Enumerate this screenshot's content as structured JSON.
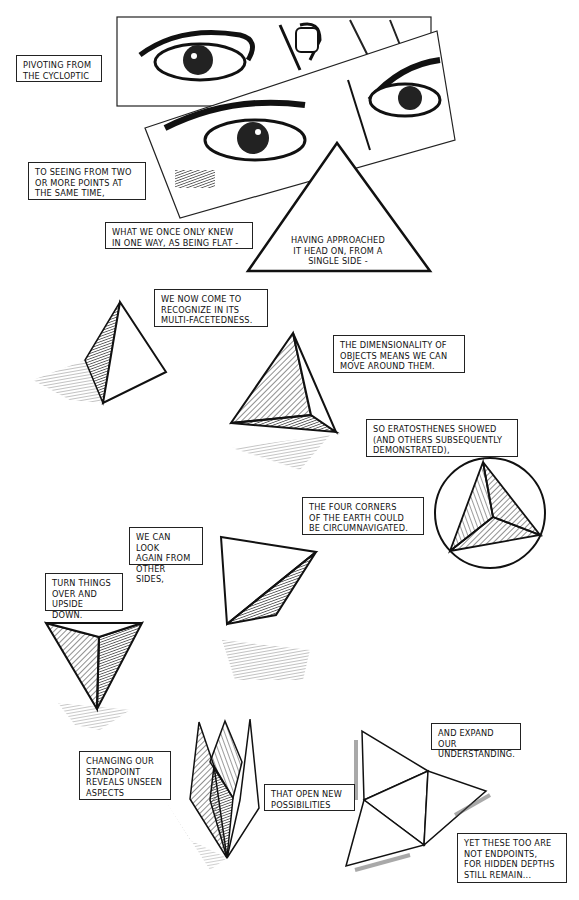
{
  "page": {
    "type": "comic-page",
    "style": "black-and-white ink illustration"
  },
  "captions": [
    {
      "id": "c1",
      "text": "PIVOTING FROM\nTHE CYCLOPTIC"
    },
    {
      "id": "c2",
      "text": "TO SEEING FROM TWO\nOR MORE POINTS AT\nTHE SAME TIME,"
    },
    {
      "id": "c3",
      "text": "WHAT WE ONCE ONLY KNEW\nIN ONE WAY, AS BEING FLAT -"
    },
    {
      "id": "c4",
      "text": "HAVING APPROACHED\nIT HEAD ON, FROM A\nSINGLE SIDE -"
    },
    {
      "id": "c5",
      "text": "WE NOW COME TO\nRECOGNIZE IN ITS\nMULTI-FACETEDNESS."
    },
    {
      "id": "c6",
      "text": "THE DIMENSIONALITY OF\nOBJECTS MEANS WE CAN\nMOVE AROUND THEM."
    },
    {
      "id": "c7",
      "text": "SO ERATOSTHENES SHOWED\n(AND OTHERS SUBSEQUENTLY\nDEMONSTRATED),"
    },
    {
      "id": "c8",
      "text": "THE FOUR CORNERS\nOF THE EARTH COULD\nBE CIRCUMNAVIGATED."
    },
    {
      "id": "c9",
      "text": "WE CAN LOOK\nAGAIN FROM\nOTHER SIDES,"
    },
    {
      "id": "c10",
      "text": "TURN THINGS\nOVER AND\nUPSIDE DOWN."
    },
    {
      "id": "c11",
      "text": "CHANGING OUR\nSTANDPOINT\nREVEALS UNSEEN\nASPECTS"
    },
    {
      "id": "c12",
      "text": "THAT OPEN NEW\nPOSSIBILITIES"
    },
    {
      "id": "c13",
      "text": "AND EXPAND OUR\nUNDERSTANDING."
    },
    {
      "id": "c14",
      "text": "YET THESE TOO ARE\nNOT ENDPOINTS,\nFOR HIDDEN DEPTHS\nSTILL REMAIN..."
    }
  ],
  "illustrations": [
    "eyes-panel-top",
    "eyes-panel-tilted",
    "flat-triangle",
    "tetrahedron-shadow-left",
    "tetrahedron-floating",
    "tetrahedron-in-circle",
    "tetrahedron-tilted",
    "tetrahedron-upside-down",
    "folded-crown-shape",
    "unfolded-tetrahedron-net"
  ],
  "colors": {
    "ink": "#111111",
    "paper": "#ffffff",
    "hatch": "#333333"
  }
}
